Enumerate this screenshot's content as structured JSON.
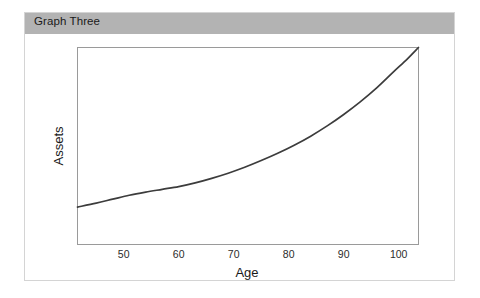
{
  "figure": {
    "title": "Graph Three",
    "title_bar_color": "#b3b3b3",
    "border_color": "#d4d4d4",
    "background": "#ffffff"
  },
  "chart_data": {
    "type": "line",
    "title": "Graph Three",
    "xlabel": "Age",
    "ylabel": "Assets",
    "xlim": [
      41.6,
      103.6
    ],
    "ylim": [
      0,
      100
    ],
    "grid": false,
    "legend": null,
    "line_color": "#3c3c3c",
    "xticks": [
      50,
      60,
      70,
      80,
      90,
      100
    ],
    "xtick_labels": [
      "50",
      "60",
      "70",
      "80",
      "90",
      "100"
    ],
    "yticks": [],
    "ytick_labels": [],
    "series": [
      {
        "name": "Assets",
        "x": [
          41.6,
          45,
          48,
          51,
          54,
          57,
          60,
          63,
          66,
          69,
          72,
          75,
          78,
          81,
          84,
          87,
          90,
          93,
          96,
          99,
          101.5,
          103.6
        ],
        "y": [
          19.0,
          21.0,
          23.0,
          25.0,
          26.6,
          28.0,
          29.4,
          31.3,
          33.6,
          36.2,
          39.2,
          42.6,
          46.3,
          50.4,
          55.0,
          60.2,
          66.0,
          72.4,
          79.5,
          87.5,
          94.0,
          100.0
        ]
      }
    ]
  }
}
